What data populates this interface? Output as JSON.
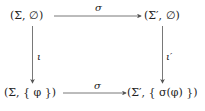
{
  "diagram": {
    "type": "commutative-square",
    "nodes": {
      "top_left": "(Σ, ∅)",
      "top_right": "(Σ′, ∅)",
      "bottom_left": "(Σ, { φ })",
      "bottom_right": "(Σ′, { σ(φ) })"
    },
    "arrows": {
      "top": {
        "from": "top_left",
        "to": "top_right",
        "label": "σ"
      },
      "bottom": {
        "from": "bottom_left",
        "to": "bottom_right",
        "label": "σ"
      },
      "left": {
        "from": "top_left",
        "to": "bottom_left",
        "label": "ι"
      },
      "right": {
        "from": "top_right",
        "to": "bottom_right",
        "label": "ι′"
      }
    },
    "colors": {
      "line": "#555555",
      "text": "#222222",
      "background": "#ffffff"
    }
  }
}
